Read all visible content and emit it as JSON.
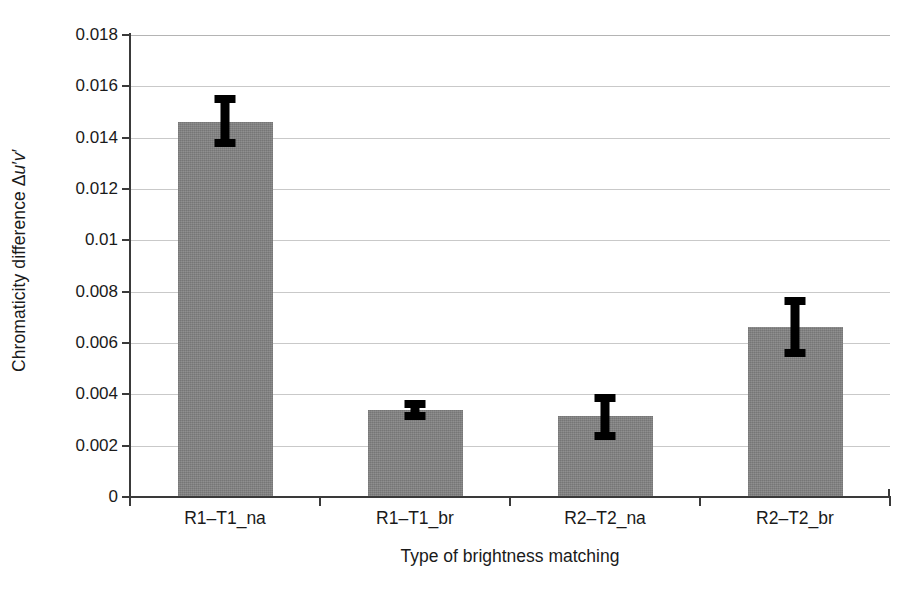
{
  "chart_data": {
    "type": "bar",
    "title": "",
    "xlabel": "Type of brightness matching",
    "ylabel": "Chromaticity difference Δu′v′",
    "ylabel_parts": {
      "prefix": "Chromaticity difference ",
      "delta": "Δ",
      "u": "u",
      "u_prime": "′",
      "v": "v",
      "v_prime": "′"
    },
    "categories": [
      "R1–T1_na",
      "R1–T1_br",
      "R2–T2_na",
      "R2–T2_br"
    ],
    "values": [
      0.01462,
      0.00339,
      0.00316,
      0.00663
    ],
    "error_low": [
      0.01365,
      0.003,
      0.00222,
      0.00546
    ],
    "error_high": [
      0.01567,
      0.00378,
      0.00402,
      0.0078
    ],
    "ylim": [
      0,
      0.018
    ],
    "ytick_values": [
      0,
      0.002,
      0.004,
      0.006,
      0.008,
      0.01,
      0.012,
      0.014,
      0.016,
      0.018
    ],
    "ytick_labels": [
      "0",
      "0.002",
      "0.004",
      "0.006",
      "0.008",
      "0.01",
      "0.012",
      "0.014",
      "0.016",
      "0.018"
    ],
    "grid": true,
    "grid_axis": "y",
    "legend": false,
    "bar_color": "#848484",
    "error_color": "#000000",
    "grid_color": "#c9c9c9",
    "axis_color": "#3a3a3a",
    "background": "#ffffff"
  }
}
